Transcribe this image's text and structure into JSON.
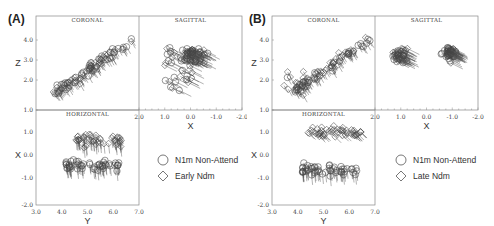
{
  "figures": [
    {
      "id": "A",
      "label": "(A)",
      "panels": {
        "coronal": {
          "title": "CORONAL",
          "xlabel": "X",
          "ylabel": "Z"
        },
        "sagittal": {
          "title": "SAGITTAL",
          "xlabel": "X"
        },
        "horizontal": {
          "title": "HORIZONTAL",
          "xlabel": "Y",
          "ylabel": "X"
        }
      },
      "legend": [
        {
          "marker": "circle",
          "label": "N1m  Non-Attend"
        },
        {
          "marker": "diamond",
          "label": "Early  Ndm"
        }
      ]
    },
    {
      "id": "B",
      "label": "(B)",
      "panels": {
        "coronal": {
          "title": "CORONAL",
          "xlabel": "X",
          "ylabel": "Z"
        },
        "sagittal": {
          "title": "SAGITTAL",
          "xlabel": "X"
        },
        "horizontal": {
          "title": "HORIZONTAL",
          "xlabel": "Y",
          "ylabel": "X"
        }
      },
      "legend": [
        {
          "marker": "circle",
          "label": "N1m  Non-Attend"
        },
        {
          "marker": "diamond",
          "label": "Late  Ndm"
        }
      ]
    }
  ],
  "axes": {
    "z_ticks": [
      "4.0",
      "3.0",
      "2.0",
      "1.0"
    ],
    "x_vertical_ticks": [
      "1.0",
      "0.0",
      "-1.0",
      "-2.0"
    ],
    "x_horizontal_ticks": [
      "2.0",
      "1.0",
      "0.0",
      "-1.0",
      "-2.0"
    ],
    "y_ticks": [
      "3.0",
      "4.0",
      "5.0",
      "6.0",
      "7.0"
    ]
  },
  "chart_data": [
    {
      "type": "scatter",
      "title": "(A) N1m Non-Attend vs Early Ndm dipole locations",
      "series": [
        {
          "name": "N1m Non-Attend",
          "marker": "circle"
        },
        {
          "name": "Early Ndm",
          "marker": "diamond"
        }
      ],
      "subplots": [
        {
          "name": "CORONAL",
          "xlabel": "X",
          "ylabel": "Z",
          "xlim": [
            2.0,
            -2.0
          ],
          "ylim": [
            1.0,
            4.5
          ]
        },
        {
          "name": "SAGITTAL",
          "xlabel": "X",
          "ylabel": "Z",
          "xlim": [
            2.0,
            -2.0
          ],
          "ylim": [
            1.0,
            4.5
          ]
        },
        {
          "name": "HORIZONTAL",
          "xlabel": "Y",
          "ylabel": "X",
          "xlim": [
            3.0,
            7.0
          ],
          "ylim": [
            -2.0,
            2.0
          ]
        }
      ]
    },
    {
      "type": "scatter",
      "title": "(B) N1m Non-Attend vs Late Ndm dipole locations",
      "series": [
        {
          "name": "N1m Non-Attend",
          "marker": "circle"
        },
        {
          "name": "Late Ndm",
          "marker": "diamond"
        }
      ],
      "subplots": [
        {
          "name": "CORONAL",
          "xlabel": "X",
          "ylabel": "Z",
          "xlim": [
            2.0,
            -2.0
          ],
          "ylim": [
            1.0,
            4.5
          ]
        },
        {
          "name": "SAGITTAL",
          "xlabel": "X",
          "ylabel": "Z",
          "xlim": [
            2.0,
            -2.0
          ],
          "ylim": [
            1.0,
            4.5
          ]
        },
        {
          "name": "HORIZONTAL",
          "xlabel": "Y",
          "ylabel": "X",
          "xlim": [
            3.0,
            7.0
          ],
          "ylim": [
            -2.0,
            2.0
          ]
        }
      ]
    }
  ]
}
